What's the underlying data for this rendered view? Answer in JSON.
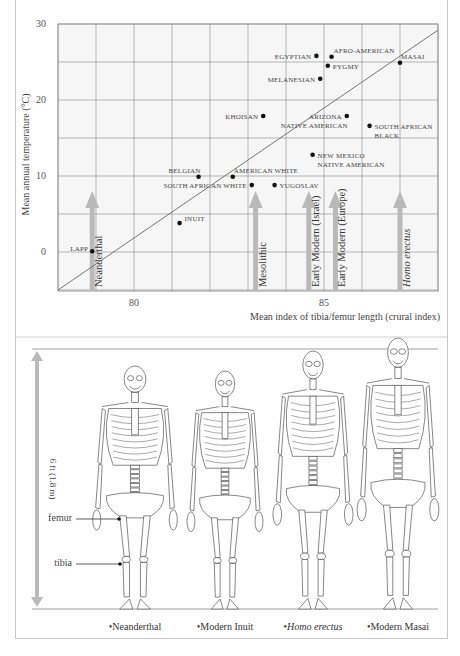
{
  "chart_data": {
    "type": "scatter",
    "title": "",
    "xlabel": "Mean index of tibia/femur length (crural index)",
    "ylabel": "Mean annual temperature (°C)",
    "xlim": [
      78,
      88
    ],
    "ylim": [
      -5,
      30
    ],
    "x_ticks": [
      80,
      85
    ],
    "y_ticks": [
      0,
      10,
      20,
      30
    ],
    "grid": true,
    "points": [
      {
        "label": "LAPP",
        "x": 78.9,
        "y": 0.1
      },
      {
        "label": "INUIT",
        "x": 81.2,
        "y": 3.8
      },
      {
        "label": "BELGIAN",
        "x": 81.7,
        "y": 9.9
      },
      {
        "label": "AMERICAN WHITE",
        "x": 82.6,
        "y": 9.9
      },
      {
        "label": "SOUTH AFRICAN WHITE",
        "x": 83.1,
        "y": 8.8
      },
      {
        "label": "YUGOSLAV",
        "x": 83.7,
        "y": 8.8
      },
      {
        "label": "KHOISAN",
        "x": 83.4,
        "y": 17.9
      },
      {
        "label": "NEW MEXICO NATIVE AMERICAN",
        "x": 84.7,
        "y": 12.8
      },
      {
        "label": "ARIZONA NATIVE AMERICAN",
        "x": 85.6,
        "y": 17.9
      },
      {
        "label": "SOUTH AFRICAN BLACK",
        "x": 86.2,
        "y": 16.6
      },
      {
        "label": "MELANESIAN",
        "x": 84.9,
        "y": 22.8
      },
      {
        "label": "EGYPTIAN",
        "x": 84.8,
        "y": 25.8
      },
      {
        "label": "AFRO-AMERICAN",
        "x": 85.2,
        "y": 25.7
      },
      {
        "label": "PYGMY",
        "x": 85.1,
        "y": 24.5
      },
      {
        "label": "MASAI",
        "x": 87.0,
        "y": 24.9
      }
    ],
    "trend_line": {
      "x": [
        78,
        88
      ],
      "y": [
        -5,
        29.2
      ]
    },
    "fossil_markers": [
      {
        "label": "Neanderthal",
        "x": 78.9,
        "italic": false
      },
      {
        "label": "Mesolithic",
        "x": 83.2,
        "italic": false
      },
      {
        "label": "Early Modern (Israel)",
        "x": 84.6,
        "italic": false
      },
      {
        "label": "Early Modern (Europe)",
        "x": 85.3,
        "italic": false
      },
      {
        "label": "Homo erectus",
        "x": 87.0,
        "italic": true
      }
    ]
  },
  "skeletons": {
    "height_scale_label": "6 ft (1.8 m)",
    "bone_labels": {
      "femur": "femur",
      "tibia": "tibia"
    },
    "figures": [
      {
        "label": "Neanderthal",
        "italic": false
      },
      {
        "label": "Modern Inuit",
        "italic": false
      },
      {
        "label": "Homo erectus",
        "italic": true
      },
      {
        "label": "Modern Masai",
        "italic": false
      }
    ]
  },
  "colors": {
    "grid": "#9a9a9a",
    "plot_bg": "#f6f6f6",
    "point": "#111111",
    "trend": "#666666",
    "arrow": "#b9b9b9",
    "text": "#333333"
  }
}
